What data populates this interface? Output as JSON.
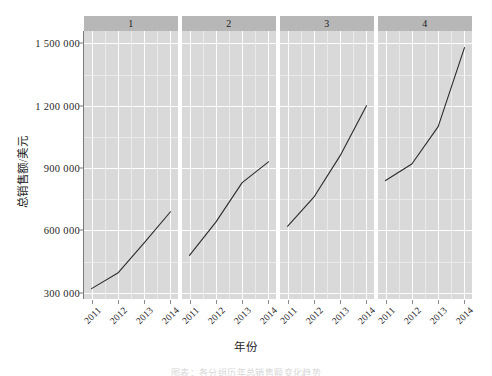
{
  "chart_data": {
    "type": "line",
    "title": "",
    "xlabel": "年份",
    "ylabel": "总销售额/美元",
    "x": [
      "2011",
      "2012",
      "2013",
      "2014"
    ],
    "ylim": [
      270000,
      1560000
    ],
    "yticks": [
      300000,
      600000,
      900000,
      1200000,
      1500000
    ],
    "ytick_labels": [
      "300 000",
      "600 000",
      "900 000",
      "1 200 000",
      "1 500 000"
    ],
    "grid": true,
    "legend": "none",
    "facet_layout": "1x4",
    "panels": [
      {
        "strip_label": "1",
        "categories": [
          "2011",
          "2012",
          "2013",
          "2014"
        ],
        "values": [
          320000,
          395000,
          540000,
          690000
        ]
      },
      {
        "strip_label": "2",
        "categories": [
          "2011",
          "2012",
          "2013",
          "2014"
        ],
        "values": [
          480000,
          640000,
          830000,
          930000
        ]
      },
      {
        "strip_label": "3",
        "categories": [
          "2011",
          "2012",
          "2013",
          "2014"
        ],
        "values": [
          620000,
          760000,
          960000,
          1200000
        ]
      },
      {
        "strip_label": "4",
        "categories": [
          "2011",
          "2012",
          "2013",
          "2014"
        ],
        "values": [
          840000,
          920000,
          1100000,
          1480000
        ]
      }
    ],
    "colors": {
      "line": "#2b2b2b",
      "panel_background": "#d9d9d9",
      "strip_background": "#b7b7b7",
      "gridline": "#fdfdfd",
      "axis": "#7a7a7a",
      "text": "#1f1f1f",
      "figure_background": "#ffffff"
    }
  },
  "caption": {
    "text": "图表：各分组历年总销售额变化趋势"
  }
}
